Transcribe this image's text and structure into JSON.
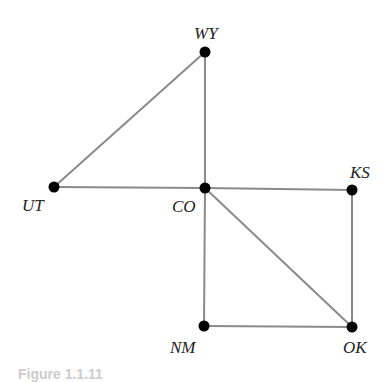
{
  "nodes": [
    {
      "id": "WY",
      "label": "WY"
    },
    {
      "id": "UT",
      "label": "UT"
    },
    {
      "id": "CO",
      "label": "CO"
    },
    {
      "id": "KS",
      "label": "KS"
    },
    {
      "id": "NM",
      "label": "NM"
    },
    {
      "id": "OK",
      "label": "OK"
    }
  ],
  "edges": [
    [
      "WY",
      "UT"
    ],
    [
      "WY",
      "CO"
    ],
    [
      "UT",
      "CO"
    ],
    [
      "CO",
      "KS"
    ],
    [
      "CO",
      "NM"
    ],
    [
      "CO",
      "OK"
    ],
    [
      "KS",
      "OK"
    ],
    [
      "NM",
      "OK"
    ]
  ],
  "caption": "Figure 1.1.11"
}
